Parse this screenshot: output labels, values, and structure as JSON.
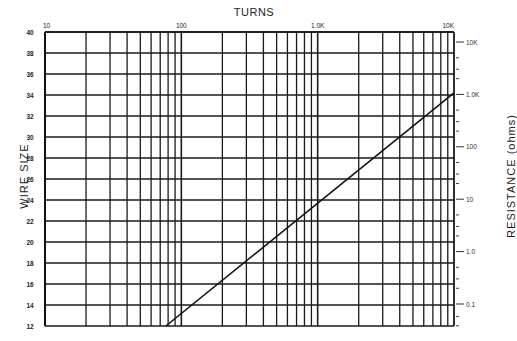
{
  "chart_data": {
    "type": "line",
    "title": "TURNS",
    "xlabel": "TURNS",
    "ylabel": "WIRE SIZE",
    "y2label": "RESISTANCE (ohms)",
    "x_scale": "log",
    "xlim": [
      10,
      10000
    ],
    "ylim": [
      12,
      40
    ],
    "x_tick_labels": [
      "10",
      "100",
      "1.0K",
      "10K"
    ],
    "y_tick_labels": [
      "40",
      "38",
      "36",
      "34",
      "32",
      "30",
      "28",
      "26",
      "24",
      "22",
      "20",
      "18",
      "16",
      "14",
      "12"
    ],
    "y2_scale": "log",
    "y2_tick_labels": [
      "10K",
      "1.0K",
      "100",
      "10",
      "1.0",
      "0.1"
    ],
    "grid": true,
    "legend": null,
    "series": [
      {
        "name": "wire size vs turns",
        "x": [
          77,
          10000
        ],
        "y": [
          12,
          34.2
        ]
      }
    ]
  },
  "labels": {
    "top": "TURNS",
    "left": "WIRE SIZE",
    "right": "RESISTANCE  (ohms)"
  }
}
